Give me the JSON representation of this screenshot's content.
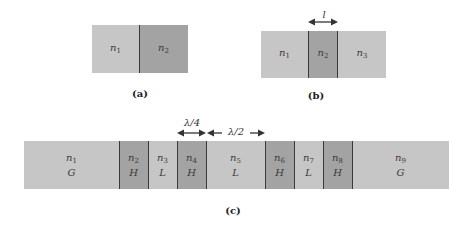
{
  "figure_a": {
    "caption": "(a)",
    "layers": [
      {
        "name": "n",
        "sub": "1",
        "shade": "light"
      },
      {
        "name": "n",
        "sub": "2",
        "shade": "dark"
      }
    ]
  },
  "figure_b": {
    "caption": "(b)",
    "thickness_label": "l",
    "layers": [
      {
        "name": "n",
        "sub": "1",
        "shade": "light"
      },
      {
        "name": "n",
        "sub": "2",
        "shade": "dark"
      },
      {
        "name": "n",
        "sub": "3",
        "shade": "light"
      }
    ]
  },
  "figure_c": {
    "caption": "(c)",
    "quarter_wave_label": "λ/4",
    "half_wave_label": "λ/2",
    "layers": [
      {
        "name": "n",
        "sub": "1",
        "type": "G",
        "shade": "light"
      },
      {
        "name": "n",
        "sub": "2",
        "type": "H",
        "shade": "dark"
      },
      {
        "name": "n",
        "sub": "3",
        "type": "L",
        "shade": "light"
      },
      {
        "name": "n",
        "sub": "4",
        "type": "H",
        "shade": "dark"
      },
      {
        "name": "n",
        "sub": "5",
        "type": "L",
        "shade": "light"
      },
      {
        "name": "n",
        "sub": "6",
        "type": "H",
        "shade": "dark"
      },
      {
        "name": "n",
        "sub": "7",
        "type": "L",
        "shade": "light"
      },
      {
        "name": "n",
        "sub": "8",
        "type": "H",
        "shade": "dark"
      },
      {
        "name": "n",
        "sub": "9",
        "type": "G",
        "shade": "light"
      }
    ]
  },
  "colors": {
    "light_layer": "#c6c6c6",
    "dark_layer": "#a3a3a3",
    "line": "#3a3a3a"
  }
}
